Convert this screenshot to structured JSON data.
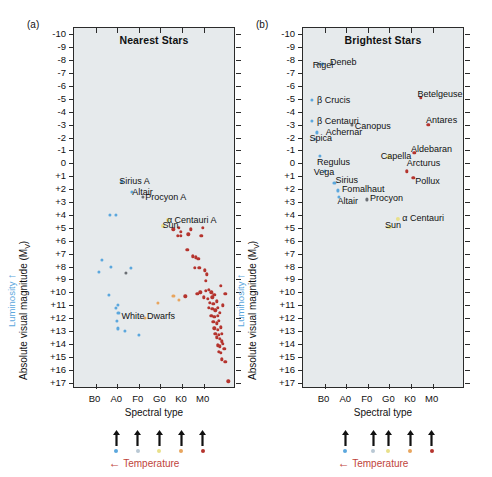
{
  "figure": {
    "panels": [
      {
        "tag": "(a)",
        "title": "Nearest Stars",
        "xlabel": "Spectral type",
        "ylabel": "Absolute visual magnitude (Mv)",
        "luminosity_label": "Luminosity",
        "temperature_label": "Temperature"
      },
      {
        "tag": "(b)",
        "title": "Brightest Stars",
        "xlabel": "Spectral type",
        "ylabel": "Absolute visual magnitude (Mv)",
        "luminosity_label": "Luminosity",
        "temperature_label": "Temperature"
      }
    ]
  },
  "chart_data": [
    {
      "type": "scatter",
      "title": "Nearest Stars",
      "panel_tag": "(a)",
      "xlabel": "Spectral type",
      "ylabel": "Absolute visual magnitude (Mv)",
      "secondary_ylabel": "Luminosity",
      "secondary_xlabel": "Temperature",
      "xticklabels": [
        "B0",
        "A0",
        "F0",
        "G0",
        "K0",
        "M0"
      ],
      "xtickvalues": [
        10,
        20,
        30,
        40,
        50,
        60
      ],
      "xlim": [
        0,
        75
      ],
      "yticklabels": [
        "-10",
        "-9",
        "-8",
        "-7",
        "-6",
        "-5",
        "-4",
        "-3",
        "-2",
        "-1",
        "0",
        "+1",
        "+2",
        "+3",
        "+4",
        "+5",
        "+6",
        "+7",
        "+8",
        "+9",
        "+10",
        "+11",
        "+12",
        "+13",
        "+14",
        "+15",
        "+16",
        "+17"
      ],
      "ylim": [
        -10.5,
        17.5
      ],
      "y_inverted": true,
      "grid": false,
      "legend": null,
      "annotations": [
        {
          "label": "Sirius A",
          "x": 21,
          "y": 1.4,
          "color": "#5ba7dd"
        },
        {
          "label": "Altair",
          "x": 27,
          "y": 2.2,
          "color": "#5ba7dd"
        },
        {
          "label": "Procyon A",
          "x": 33,
          "y": 2.6,
          "color": "#6b6f74"
        },
        {
          "label": "α Centauri A",
          "x": 43,
          "y": 4.4,
          "color": "#e8e08a"
        },
        {
          "label": "Sun",
          "x": 41,
          "y": 4.8,
          "color": "#e8e08a"
        },
        {
          "label": "White Dwarfs",
          "x": 22,
          "y": 11.8,
          "color": "#5ba7dd"
        }
      ],
      "series": [
        {
          "name": "Blue / white main sequence and white dwarfs",
          "color": "#5ba7dd",
          "points": [
            [
              22.0,
              1.4
            ],
            [
              26.8,
              2.2
            ],
            [
              16.5,
              4.0
            ],
            [
              19.5,
              4.0
            ],
            [
              13.0,
              7.5
            ],
            [
              11.5,
              8.4
            ],
            [
              17.0,
              8.0
            ],
            [
              16.0,
              10.2
            ],
            [
              19.5,
              11.2
            ],
            [
              20.2,
              11.0
            ],
            [
              20.6,
              11.6
            ],
            [
              19.8,
              12.2
            ],
            [
              20.5,
              12.8
            ],
            [
              23.5,
              13.0
            ],
            [
              30.0,
              13.3
            ],
            [
              26.5,
              8.1
            ]
          ]
        },
        {
          "name": "Solar type (yellow)",
          "color": "#e8e08a",
          "points": [
            [
              41.0,
              4.85
            ],
            [
              43.5,
              4.4
            ]
          ]
        },
        {
          "name": "Orange K dwarfs",
          "color": "#e8a55e",
          "points": [
            [
              46.0,
              10.3
            ],
            [
              33.0,
              12.0
            ],
            [
              48.5,
              10.6
            ],
            [
              39.0,
              10.8
            ]
          ]
        },
        {
          "name": "Red M dwarfs",
          "color": "#b5342e",
          "points": [
            [
              46.0,
              5.1
            ],
            [
              48.5,
              5.0
            ],
            [
              49.5,
              5.3
            ],
            [
              54.0,
              5.1
            ],
            [
              59.5,
              5.0
            ],
            [
              48.0,
              5.6
            ],
            [
              49.5,
              5.6
            ],
            [
              53.0,
              5.5
            ],
            [
              59.0,
              5.6
            ],
            [
              52.5,
              6.7
            ],
            [
              55.0,
              7.2
            ],
            [
              56.5,
              7.3
            ],
            [
              57.5,
              7.4
            ],
            [
              56.0,
              8.1
            ],
            [
              58.0,
              8.1
            ],
            [
              60.5,
              8.3
            ],
            [
              61.5,
              8.6
            ],
            [
              61.0,
              9.1
            ],
            [
              58.5,
              10.0
            ],
            [
              61.0,
              9.9
            ],
            [
              62.5,
              9.8
            ],
            [
              63.5,
              10.0
            ],
            [
              51.5,
              10.3
            ],
            [
              57.0,
              10.1
            ],
            [
              60.0,
              10.4
            ],
            [
              62.0,
              10.5
            ],
            [
              64.0,
              10.4
            ],
            [
              65.0,
              10.2
            ],
            [
              63.0,
              10.8
            ],
            [
              64.5,
              10.9
            ],
            [
              66.0,
              10.7
            ],
            [
              62.5,
              11.2
            ],
            [
              64.0,
              11.3
            ],
            [
              65.5,
              11.4
            ],
            [
              66.5,
              11.2
            ],
            [
              63.5,
              11.8
            ],
            [
              65.0,
              11.9
            ],
            [
              66.5,
              11.8
            ],
            [
              64.5,
              12.3
            ],
            [
              66.0,
              12.4
            ],
            [
              67.0,
              12.2
            ],
            [
              65.0,
              12.8
            ],
            [
              66.5,
              12.9
            ],
            [
              68.0,
              12.7
            ],
            [
              65.5,
              13.2
            ],
            [
              67.0,
              13.3
            ],
            [
              68.5,
              13.2
            ],
            [
              66.0,
              13.5
            ],
            [
              67.5,
              13.6
            ],
            [
              66.5,
              14.1
            ],
            [
              67.5,
              14.2
            ],
            [
              69.0,
              14.0
            ],
            [
              67.0,
              14.6
            ],
            [
              68.0,
              14.7
            ],
            [
              68.5,
              15.2
            ],
            [
              70.0,
              15.4
            ],
            [
              71.5,
              16.9
            ],
            [
              69.0,
              11.0
            ],
            [
              70.0,
              10.1
            ],
            [
              68.0,
              9.5
            ],
            [
              67.5,
              11.6
            ],
            [
              68.5,
              13.8
            ],
            [
              69.5,
              14.4
            ]
          ]
        },
        {
          "name": "Dark grey (Procyon A)",
          "color": "#6b6f74",
          "points": [
            [
              32.0,
              2.6
            ],
            [
              24.0,
              8.5
            ]
          ]
        }
      ],
      "temperature_swatches": [
        {
          "x": 20,
          "color": "#5ba7dd"
        },
        {
          "x": 30,
          "color": "#b9c8d4"
        },
        {
          "x": 40,
          "color": "#e8e08a"
        },
        {
          "x": 50,
          "color": "#e8a55e"
        },
        {
          "x": 60,
          "color": "#b5342e"
        }
      ]
    },
    {
      "type": "scatter",
      "title": "Brightest Stars",
      "panel_tag": "(b)",
      "xlabel": "Spectral type",
      "ylabel": "Absolute visual magnitude (Mv)",
      "secondary_ylabel": "Luminosity",
      "secondary_xlabel": "Temperature",
      "xticklabels": [
        "B0",
        "A0",
        "F0",
        "G0",
        "K0",
        "M0"
      ],
      "xtickvalues": [
        10,
        20,
        30,
        40,
        50,
        60
      ],
      "xlim": [
        0,
        75
      ],
      "yticklabels": [
        "-10",
        "-9",
        "-8",
        "-7",
        "-6",
        "-5",
        "-4",
        "-3",
        "-2",
        "-1",
        "0",
        "+1",
        "+2",
        "+3",
        "+4",
        "+5",
        "+6",
        "+7",
        "+8",
        "+9",
        "+10",
        "+11",
        "+12",
        "+13",
        "+14",
        "+15",
        "+16",
        "+17"
      ],
      "ylim": [
        -10.5,
        17.5
      ],
      "y_inverted": true,
      "grid": false,
      "legend": null,
      "annotations": [
        {
          "label": "Rigel",
          "x": 4.5,
          "y": -7.6,
          "color": "#6b6f74"
        },
        {
          "label": "Deneb",
          "x": 12.5,
          "y": -7.9,
          "color": "#9fd0ee"
        },
        {
          "label": "Betelgeuse",
          "x": 53.0,
          "y": -5.4,
          "color": "#b5342e"
        },
        {
          "label": "β Crucis",
          "x": 6.5,
          "y": -4.9,
          "color": "#5ba7dd"
        },
        {
          "label": "β Centauri",
          "x": 6.5,
          "y": -3.3,
          "color": "#5ba7dd"
        },
        {
          "label": "Antares",
          "x": 57.0,
          "y": -3.4,
          "color": "#b5342e"
        },
        {
          "label": "Canopus",
          "x": 24.0,
          "y": -2.9,
          "color": "#6b6f74"
        },
        {
          "label": "Achernar",
          "x": 10.5,
          "y": -2.4,
          "color": "#9fd0ee"
        },
        {
          "label": "Spica",
          "x": 3.0,
          "y": -2.0,
          "color": "#5ba7dd"
        },
        {
          "label": "Aldebaran",
          "x": 50.0,
          "y": -1.1,
          "color": "#b5342e"
        },
        {
          "label": "Capella",
          "x": 36.0,
          "y": -0.6,
          "color": "#e8e08a"
        },
        {
          "label": "Regulus",
          "x": 6.5,
          "y": -0.1,
          "color": "#5ba7dd"
        },
        {
          "label": "Arcturus",
          "x": 48.0,
          "y": 0.0,
          "color": "#b5342e"
        },
        {
          "label": "Vega",
          "x": 5.0,
          "y": 0.7,
          "color": "#9fd0ee"
        },
        {
          "label": "Sirius",
          "x": 15.0,
          "y": 1.3,
          "color": "#5ba7dd"
        },
        {
          "label": "Pollux",
          "x": 52.0,
          "y": 1.4,
          "color": "#b5342e"
        },
        {
          "label": "Fomalhaut",
          "x": 18.0,
          "y": 2.0,
          "color": "#5ba7dd"
        },
        {
          "label": "Altair",
          "x": 16.0,
          "y": 2.9,
          "color": "#9fd0ee"
        },
        {
          "label": "Procyon",
          "x": 31.0,
          "y": 2.7,
          "color": "#6b6f74"
        },
        {
          "label": "α Centauri",
          "x": 46.0,
          "y": 4.2,
          "color": "#e8e08a"
        },
        {
          "label": "Sun",
          "x": 38.0,
          "y": 4.8,
          "color": "#e8e08a"
        }
      ],
      "series": [
        {
          "name": "Blue supergiants and main sequence",
          "color": "#5ba7dd",
          "points": [
            [
              9.0,
              -7.7
            ],
            [
              4.0,
              -4.9
            ],
            [
              4.0,
              -3.3
            ],
            [
              6.5,
              -2.4
            ],
            [
              5.5,
              -1.9
            ],
            [
              8.0,
              -0.6
            ],
            [
              10.0,
              0.6
            ],
            [
              14.5,
              1.5
            ],
            [
              16.0,
              2.1
            ],
            [
              16.5,
              2.6
            ]
          ]
        },
        {
          "name": "Grey (Rigel, Canopus, Procyon)",
          "color": "#6b6f74",
          "points": [
            [
              7.5,
              -7.7
            ],
            [
              22.5,
              -3.0
            ],
            [
              29.5,
              2.8
            ]
          ]
        },
        {
          "name": "Yellow giants / solar",
          "color": "#e8e08a",
          "points": [
            [
              39.5,
              -0.5
            ],
            [
              44.0,
              4.3
            ],
            [
              40.0,
              4.9
            ]
          ]
        },
        {
          "name": "Red giants and supergiants",
          "color": "#b5342e",
          "points": [
            [
              54.5,
              -5.1
            ],
            [
              58.0,
              -3.0
            ],
            [
              51.5,
              -0.8
            ],
            [
              48.0,
              0.6
            ],
            [
              51.0,
              1.1
            ]
          ]
        }
      ],
      "temperature_swatches": [
        {
          "x": 20,
          "color": "#5ba7dd"
        },
        {
          "x": 33,
          "color": "#b9c8d4"
        },
        {
          "x": 40,
          "color": "#e8e08a"
        },
        {
          "x": 50,
          "color": "#e8a55e"
        },
        {
          "x": 60,
          "color": "#b5342e"
        }
      ]
    }
  ]
}
